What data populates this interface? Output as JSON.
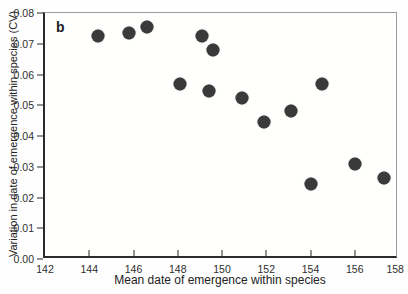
{
  "figure": {
    "panel_label": "b"
  },
  "colors": {
    "dot": "#3a3a3a",
    "axis": "#2b2b2b",
    "frame_light": "#9b9b9b"
  },
  "chart_data": {
    "type": "scatter",
    "title": "",
    "xlabel": "Mean date of emergence within species",
    "ylabel": "Variation in date of emergence within species (CV)",
    "xlim": [
      142,
      158
    ],
    "ylim": [
      0,
      0.08
    ],
    "x_ticks": [
      142,
      144,
      146,
      148,
      150,
      152,
      154,
      156,
      158
    ],
    "x_tick_labels": [
      "142",
      "144",
      "146",
      "148",
      "150",
      "152",
      "154",
      "156",
      "158"
    ],
    "y_ticks": [
      0,
      0.01,
      0.02,
      0.03,
      0.04,
      0.05,
      0.06,
      0.07,
      0.08
    ],
    "y_tick_labels": [
      "0.00",
      "0.01",
      "0.02",
      "0.03",
      "0.04",
      "0.05",
      "0.06",
      "0.07",
      "0.08"
    ],
    "grid": false,
    "legend": null,
    "marker": {
      "shape": "circle",
      "diameter_px": 13,
      "color": "#3a3a3a"
    },
    "points": [
      {
        "x": 144.4,
        "y": 0.0725
      },
      {
        "x": 145.8,
        "y": 0.0735
      },
      {
        "x": 146.6,
        "y": 0.0755
      },
      {
        "x": 148.1,
        "y": 0.057
      },
      {
        "x": 149.1,
        "y": 0.0725
      },
      {
        "x": 149.4,
        "y": 0.0545
      },
      {
        "x": 149.6,
        "y": 0.068
      },
      {
        "x": 150.9,
        "y": 0.0525
      },
      {
        "x": 151.9,
        "y": 0.0445
      },
      {
        "x": 153.1,
        "y": 0.048
      },
      {
        "x": 154.0,
        "y": 0.0245
      },
      {
        "x": 154.5,
        "y": 0.057
      },
      {
        "x": 156.0,
        "y": 0.031
      },
      {
        "x": 157.3,
        "y": 0.0265
      }
    ]
  }
}
